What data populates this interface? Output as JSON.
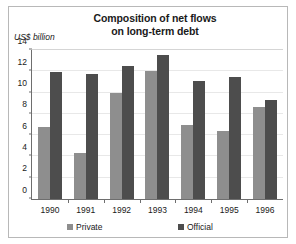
{
  "chart_data": {
    "type": "bar",
    "title": "Composition of net flows on long-term debt",
    "title_lines": [
      "Composition of net flows",
      "on long-term debt"
    ],
    "ylabel": "US$ billion",
    "xlabel": "",
    "categories": [
      "1990",
      "1991",
      "1992",
      "1993",
      "1994",
      "1995",
      "1996"
    ],
    "series": [
      {
        "name": "Private",
        "color": "#8e8e8e",
        "values": [
          6.8,
          4.3,
          10.0,
          12.0,
          7.0,
          6.35,
          8.65
        ]
      },
      {
        "name": "Official",
        "color": "#4d4d4d",
        "values": [
          11.9,
          11.7,
          12.5,
          13.5,
          11.1,
          11.45,
          9.3
        ]
      }
    ],
    "ylim": [
      0,
      14
    ],
    "yticks": [
      0,
      2,
      4,
      6,
      8,
      10,
      12,
      14
    ],
    "ytick_labels": [
      "0",
      "2",
      "4",
      "6",
      "8",
      "10",
      "12",
      "14"
    ],
    "grid": true,
    "legend_position": "bottom"
  },
  "legend": {
    "private_label": "Private",
    "official_label": "Official"
  }
}
